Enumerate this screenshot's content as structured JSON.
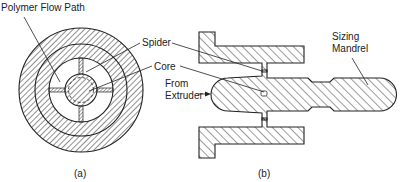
{
  "figure": {
    "panel_a": {
      "caption": "(a)",
      "labels": {
        "polymer_flow_path": "Polymer Flow Path",
        "spider": "Spider",
        "core": "Core"
      }
    },
    "panel_b": {
      "caption": "(b)",
      "labels": {
        "from_extruder_line1": "From",
        "from_extruder_line2": "Extruder",
        "sizing_mandrel_line1": "Sizing",
        "sizing_mandrel_line2": "Mandrel"
      }
    },
    "colors": {
      "ink": "#222222",
      "background": "#ffffff"
    }
  }
}
